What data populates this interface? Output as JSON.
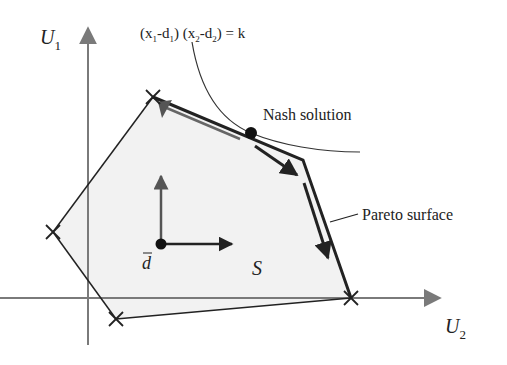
{
  "diagram": {
    "axes": {
      "y_label": "U",
      "y_sub": "1",
      "x_label": "U",
      "x_sub": "2"
    },
    "curve_equation": "(x₁-d₁) (x₂-d₂) = k",
    "equation_parts": {
      "open1": "(x",
      "sub1": "1",
      "mid1": "-d",
      "sub2": "1",
      "close1": ") (x",
      "sub3": "2",
      "mid2": "-d",
      "sub4": "2",
      "close2": ") = k"
    },
    "labels": {
      "nash": "Nash solution",
      "pareto": "Pareto surface",
      "region": "S",
      "disagreement_point": "d"
    },
    "colors": {
      "region_fill": "#f3f3f3",
      "line": "#222222",
      "axis": "#777777"
    },
    "vertices": [
      {
        "x": 153,
        "y": 97
      },
      {
        "x": 303,
        "y": 160
      },
      {
        "x": 351,
        "y": 298
      },
      {
        "x": 116,
        "y": 319
      },
      {
        "x": 53,
        "y": 232
      }
    ],
    "nash_point": {
      "x": 251,
      "y": 133
    },
    "d_point": {
      "x": 161,
      "y": 244
    }
  }
}
